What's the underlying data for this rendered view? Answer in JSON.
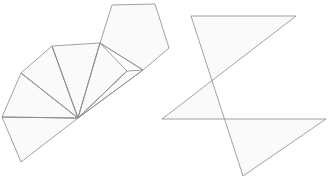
{
  "canvas": {
    "width": 329,
    "height": 179,
    "background": "#ffffff",
    "line_color": "#8a8a8a",
    "fill_color": "#fafafa",
    "stroke_width": 0.8
  },
  "figures": [
    {
      "name": "pentagonal-pyramid-net",
      "label": "",
      "hub_vertex": [
        78,
        118
      ],
      "faces": [
        {
          "name": "triangle-1",
          "points": "78,118 2,117 21,162"
        },
        {
          "name": "triangle-2",
          "points": "78,118 2,117 21,73"
        },
        {
          "name": "triangle-3",
          "points": "78,118 21,73 52,46"
        },
        {
          "name": "triangle-4",
          "points": "78,118 52,46 100,43"
        },
        {
          "name": "triangle-5",
          "points": "78,118 100,43 127,71"
        },
        {
          "name": "triangle-6",
          "points": "78,118 127,71 143,70"
        },
        {
          "name": "pentagon-face",
          "points": "100,43 112,5 155,4 169,48 143,70"
        }
      ],
      "fold_lines": [
        {
          "name": "fold-hub-to-left",
          "d": "M 78,118 L 2,117"
        },
        {
          "name": "fold-hub-to-upper-left",
          "d": "M 78,118 L 21,73"
        },
        {
          "name": "fold-hub-to-top-left",
          "d": "M 78,118 L 52,46"
        },
        {
          "name": "fold-hub-to-top",
          "d": "M 78,118 L 100,43"
        },
        {
          "name": "fold-hub-to-right",
          "d": "M 78,118 L 127,71"
        },
        {
          "name": "fold-hub-to-pentagon",
          "d": "M 78,118 L 143,70"
        },
        {
          "name": "fold-pentagon-base",
          "d": "M 100,43 L 143,70"
        }
      ]
    },
    {
      "name": "pentagram-star",
      "label": "",
      "points": "191,16 243,176 326,119 162,119 296,16",
      "star_tips": [
        [
          191,
          16
        ],
        [
          296,
          16
        ],
        [
          326,
          119
        ],
        [
          243,
          176
        ],
        [
          162,
          119
        ]
      ]
    }
  ]
}
